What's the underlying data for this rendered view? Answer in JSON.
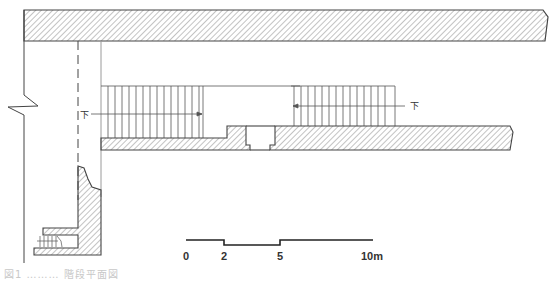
{
  "figure": {
    "type": "architectural stair plan drawing",
    "labels": {
      "left_stair_direction": "下",
      "right_stair_direction": "下"
    },
    "scale_bar": {
      "ticks": [
        "0",
        "2",
        "5",
        "10m"
      ],
      "unit": "m"
    },
    "caption_partial": "図1 ……… 階段平面図"
  },
  "colors": {
    "line": "#444444",
    "hatch": "#777777",
    "light_line": "#9a9a9a",
    "background": "#ffffff"
  }
}
